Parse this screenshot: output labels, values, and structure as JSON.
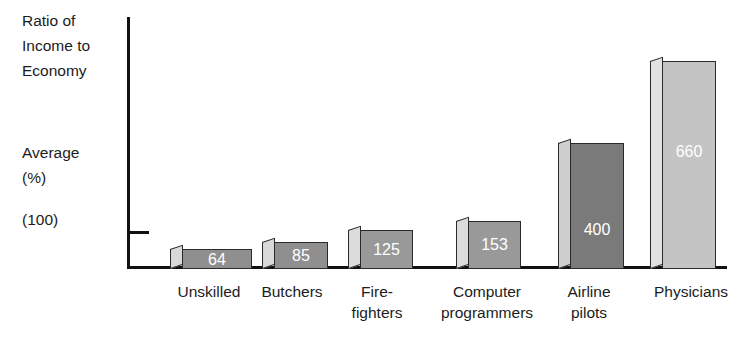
{
  "axis": {
    "title": "Ratio of\nIncome to\nEconomy",
    "average_label": "Average",
    "percent_label": "(%)",
    "baseline_label": "(100)"
  },
  "chart_data": {
    "type": "bar",
    "title": "",
    "subtitle": "",
    "xlabel": "",
    "ylabel": "Ratio of Income to Economy Average (%) (100)",
    "ylim": [
      0,
      700
    ],
    "grid": false,
    "legend": "none",
    "baseline_reference": 100,
    "categories": [
      "Unskilled",
      "Butchers",
      "Fire-\nfighters",
      "Computer\nprogrammers",
      "Airline\npilots",
      "Physicians"
    ],
    "values": [
      64,
      85,
      125,
      153,
      400,
      660
    ],
    "value_labels": [
      "64",
      "85",
      "125",
      "153",
      "400",
      "660"
    ],
    "bar_colors": [
      "#8f8f8f",
      "#8f8f8f",
      "#999999",
      "#999999",
      "#7a7a7a",
      "#c4c4c4"
    ],
    "bar_side_colors": [
      "#d9d9d9",
      "#d9d9d9",
      "#dcdcdc",
      "#dcdcdc",
      "#cfcfcf",
      "#e2e2e2"
    ]
  }
}
